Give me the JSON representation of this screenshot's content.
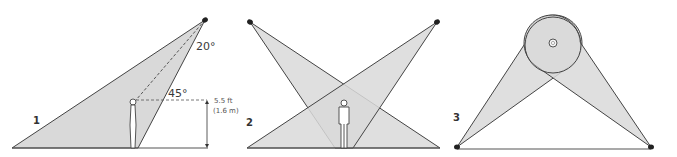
{
  "colors": {
    "cone_fill": "#d9d9d9",
    "stroke": "#444444",
    "light": "#222222",
    "ground": "#555555",
    "background": "#ffffff"
  },
  "panels": [
    {
      "number": "1",
      "labels": {
        "angle_top": "20°",
        "angle_mid": "45°",
        "height_ft": "5.5 ft",
        "height_m": "(1.6 m)"
      }
    },
    {
      "number": "2"
    },
    {
      "number": "3"
    }
  ]
}
